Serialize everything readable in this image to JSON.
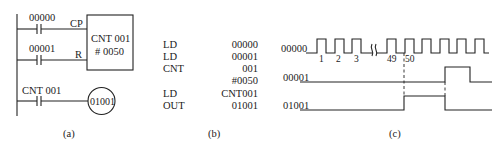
{
  "ladder": {
    "contact1_label": "00000",
    "contact2_label": "00001",
    "cp_label": "CP",
    "r_label": "R",
    "counter_name": "CNT 001",
    "counter_preset": "# 0050",
    "contact3_label": "CNT 001",
    "coil_label": "01001",
    "caption": "(a)"
  },
  "mnemonic": {
    "rows": [
      {
        "op": "LD",
        "arg": "00000"
      },
      {
        "op": "LD",
        "arg": "00001"
      },
      {
        "op": "CNT",
        "arg": "001"
      },
      {
        "op": "",
        "arg": "#0050"
      },
      {
        "op": "LD",
        "arg": "CNT001"
      },
      {
        "op": "OUT",
        "arg": "01001"
      }
    ],
    "caption": "(b)"
  },
  "timing": {
    "signals": [
      {
        "name": "00000"
      },
      {
        "name": "00001"
      },
      {
        "name": "01001"
      }
    ],
    "pulse_numbers": [
      "1",
      "2",
      "3",
      "49",
      "50"
    ],
    "break_symbol": "≀≀",
    "caption": "(c)"
  }
}
